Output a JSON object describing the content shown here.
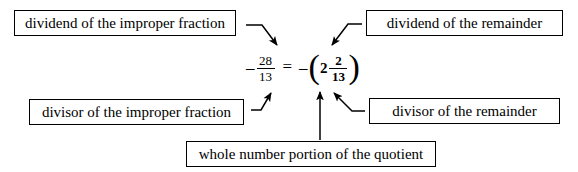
{
  "diagram": {
    "expression": {
      "left": {
        "sign": "–",
        "numerator": "28",
        "denominator": "13"
      },
      "equals": "=",
      "right": {
        "sign": "–",
        "open_paren": "(",
        "whole": "2",
        "numerator": "2",
        "denominator": "13",
        "close_paren": ")"
      }
    },
    "labels": {
      "dividend_improper": "dividend of the improper fraction",
      "dividend_remainder": "dividend of the remainder",
      "divisor_improper": "divisor of the improper fraction",
      "divisor_remainder": "divisor of the remainder",
      "whole_number": "whole number portion of the quotient"
    },
    "arrows": [
      {
        "name": "arrow-dividend-improper-to-numerator",
        "from": "dividend of the improper fraction",
        "to": "28"
      },
      {
        "name": "arrow-dividend-remainder-to-numerator",
        "from": "dividend of the remainder",
        "to": "2 (numerator of remainder)"
      },
      {
        "name": "arrow-divisor-improper-to-denominator",
        "from": "divisor of the improper fraction",
        "to": "13"
      },
      {
        "name": "arrow-divisor-remainder-to-denominator",
        "from": "divisor of the remainder",
        "to": "13 (denominator of remainder)"
      },
      {
        "name": "arrow-whole-number-to-whole",
        "from": "whole number portion of the quotient",
        "to": "2 (whole number)"
      }
    ],
    "colors": {
      "background": "#ffffff",
      "ink": "#000000"
    }
  }
}
